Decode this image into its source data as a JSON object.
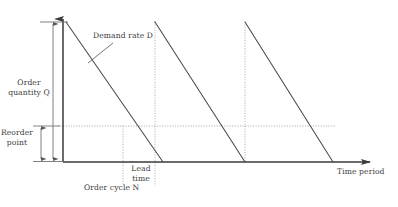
{
  "figure": {
    "type": "inventory-sawtooth-diagram",
    "title": "",
    "background_color": "#ffffff",
    "line_color": "#4a4a4a",
    "axis_color": "#4a4a4a",
    "dotted_color": "#9a9a9a",
    "text_color": "#3b3b3b"
  },
  "labels": {
    "demand_rate": "Demand rate D",
    "order_quantity_line1": "Order",
    "order_quantity_line2": "quantity Q",
    "reorder_point_line1": "Reorder",
    "reorder_point_line2": "point",
    "lead_time_line1": "Lead",
    "lead_time_line2": "time",
    "order_cycle": "Order cycle N",
    "time_period": "Time period"
  },
  "chart_data": {
    "type": "line",
    "title": "",
    "xlabel": "Time period",
    "ylabel": "Order quantity Q",
    "grid": false,
    "legend_position": "none",
    "axis": {
      "x_start_px": 63,
      "x_end_px": 378,
      "y_baseline_px": 162,
      "y_top_px": 9,
      "x_arrow": true,
      "y_arrow": true
    },
    "levels": {
      "order_quantity_Q": 1.0,
      "reorder_point": 0.26,
      "zero": 0.0
    },
    "series": [
      {
        "name": "Inventory level",
        "description": "Sawtooth: instantaneous replenishment to Q, then linear depletion at demand rate D to zero",
        "cycles": [
          {
            "peak_x": 66,
            "peak_y": 22,
            "trough_x": 163,
            "trough_y": 162
          },
          {
            "peak_x": 155,
            "peak_y": 22,
            "trough_x": 245,
            "trough_y": 162
          },
          {
            "peak_x": 245,
            "peak_y": 22,
            "trough_x": 333,
            "trough_y": 162
          }
        ]
      }
    ],
    "reference_lines": [
      {
        "kind": "horizontal-dotted",
        "label": "Reorder point",
        "y_px": 126,
        "x_from_px": 58,
        "x_to_px": 336
      },
      {
        "kind": "vertical-dotted",
        "label": "lead-time-start",
        "x_px": 123,
        "y_from_px": 126,
        "y_to_px": 186
      },
      {
        "kind": "vertical-dotted",
        "label": "cycle-2-start",
        "x_px": 155,
        "y_from_px": 22,
        "y_to_px": 186
      },
      {
        "kind": "vertical-dotted",
        "label": "cycle-3-start",
        "x_px": 245,
        "y_from_px": 22,
        "y_to_px": 162
      }
    ],
    "dimension_arrows": [
      {
        "name": "order-quantity",
        "x_px": 53,
        "y_top_px": 22,
        "y_bottom_px": 161,
        "label": "Order quantity Q"
      },
      {
        "name": "reorder-point",
        "x_px": 41,
        "y_top_px": 126,
        "y_bottom_px": 161,
        "label": "Reorder point"
      }
    ],
    "annotations": [
      {
        "text": "Demand rate D",
        "x_px": 92,
        "y_px": 34,
        "leader_to_x": 88,
        "leader_to_y": 63
      },
      {
        "text": "Lead time",
        "x_px": 124,
        "y_px": 165
      },
      {
        "text": "Order cycle N",
        "x_px": 82,
        "y_px": 184
      },
      {
        "text": "Time period",
        "x_px": 338,
        "y_px": 170
      }
    ]
  }
}
